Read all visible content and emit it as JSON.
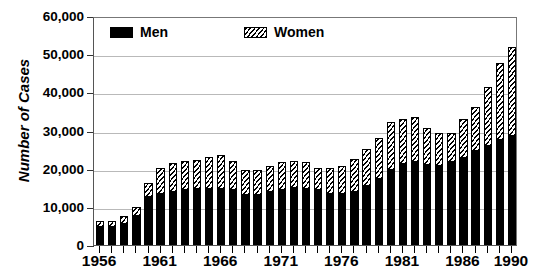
{
  "chart_data": {
    "type": "bar",
    "subtype": "stacked-vertical",
    "title": "",
    "xlabel": "",
    "ylabel": "Number of Cases",
    "ylim": [
      0,
      60000
    ],
    "ytick_values": [
      0,
      10000,
      20000,
      30000,
      40000,
      50000,
      60000
    ],
    "ytick_labels": [
      "0",
      "10,000",
      "20,000",
      "30,000",
      "40,000",
      "50,000",
      "60,000"
    ],
    "grid": true,
    "grid_axis": "y",
    "legend_position": "top-left-inside",
    "categories": [
      "1956",
      "1957",
      "1958",
      "1959",
      "1960",
      "1961",
      "1962",
      "1963",
      "1964",
      "1965",
      "1966",
      "1967",
      "1968",
      "1969",
      "1970",
      "1971",
      "1972",
      "1973",
      "1974",
      "1975",
      "1976",
      "1977",
      "1978",
      "1979",
      "1980",
      "1981",
      "1982",
      "1983",
      "1984",
      "1985",
      "1986",
      "1987",
      "1988",
      "1989",
      "1990"
    ],
    "xtick_labels": [
      "1956",
      "1961",
      "1966",
      "1971",
      "1976",
      "1981",
      "1986",
      "1990"
    ],
    "xtick_categories": [
      "1956",
      "1961",
      "1966",
      "1971",
      "1976",
      "1981",
      "1986",
      "1990"
    ],
    "series": [
      {
        "name": "Men",
        "color": "#000000",
        "fill": "solid-black",
        "values": [
          4700,
          4800,
          5400,
          7600,
          12700,
          13400,
          13900,
          14500,
          14700,
          14800,
          14600,
          14500,
          13000,
          13200,
          13900,
          14300,
          14900,
          14800,
          14300,
          13300,
          13300,
          13900,
          15500,
          17400,
          19700,
          21300,
          21700,
          21000,
          20700,
          21700,
          22800,
          24600,
          25900,
          27500,
          28500
        ]
      },
      {
        "name": "Women",
        "color": "#ffffff",
        "fill": "diagonal-hatch",
        "values": [
          1500,
          1500,
          2100,
          2400,
          3600,
          6700,
          7600,
          7400,
          7700,
          8200,
          9100,
          7400,
          6700,
          6500,
          6900,
          7500,
          7200,
          6900,
          5800,
          6800,
          7400,
          8700,
          9600,
          10600,
          12600,
          11700,
          11900,
          9700,
          8600,
          7600,
          10100,
          11600,
          15400,
          20200,
          23500
        ]
      }
    ],
    "totals": [
      6200,
      6300,
      7500,
      10000,
      16300,
      20100,
      21500,
      21900,
      22400,
      23000,
      23700,
      21900,
      19700,
      19700,
      20800,
      21800,
      22100,
      21700,
      20100,
      20100,
      20700,
      22600,
      25100,
      28000,
      32300,
      33000,
      33600,
      30700,
      29300,
      29300,
      32900,
      36200,
      41300,
      47700,
      52000
    ]
  },
  "axes": {
    "y_title": "Number of Cases"
  },
  "legend": {
    "entries": [
      {
        "label": "Men"
      },
      {
        "label": "Women"
      }
    ]
  }
}
